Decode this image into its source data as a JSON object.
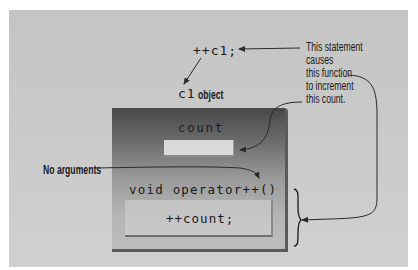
{
  "diagram": {
    "statement": "++c1;",
    "object_label_code": "c1",
    "object_label_text": "object",
    "object_box": {
      "member_label": "count",
      "function_signature": "void operator++()",
      "function_body": "++count;"
    },
    "annotation_right": {
      "lines": [
        "This statement",
        "causes",
        "this function",
        "to increment",
        "this count."
      ]
    },
    "annotation_left": "No arguments"
  },
  "colors": {
    "panel": "#c8c8c8",
    "box_top": "#484848",
    "box_bottom": "#bdbdbd",
    "line": "#2a2a2a"
  }
}
